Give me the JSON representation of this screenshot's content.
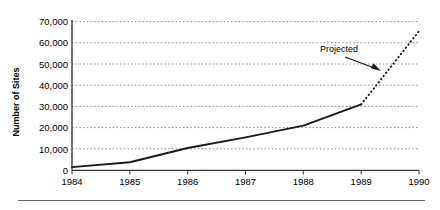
{
  "chart_data": {
    "type": "line",
    "title": "",
    "xlabel": "",
    "ylabel": "Number of Sites",
    "x": [
      1984,
      1985,
      1986,
      1987,
      1988,
      1989,
      1990
    ],
    "xtick_labels": [
      "1984",
      "1985",
      "1986",
      "1987",
      "1988",
      "1989",
      "1990"
    ],
    "ytick_labels": [
      "0",
      "10,000",
      "20,000",
      "30,000",
      "40,000",
      "50,000",
      "60,000",
      "70,000"
    ],
    "ytick_values": [
      0,
      10000,
      20000,
      30000,
      40000,
      50000,
      60000,
      70000
    ],
    "ylim": [
      0,
      70000
    ],
    "xlim": [
      1984,
      1990
    ],
    "grid": "horizontal-dotted",
    "legend": "none",
    "series": [
      {
        "name": "Actual",
        "style": "solid",
        "color": "#1a1a1a",
        "x": [
          1984,
          1985,
          1986,
          1987,
          1988,
          1989
        ],
        "values": [
          1500,
          3800,
          10500,
          15500,
          21000,
          31000
        ]
      },
      {
        "name": "Projected",
        "style": "dotted",
        "color": "#1a1a1a",
        "x": [
          1989,
          1990
        ],
        "values": [
          31000,
          65500
        ]
      }
    ],
    "annotations": [
      {
        "text": "Projected",
        "x": 1988.3,
        "y": 47000,
        "arrow_to_x": 1989.3,
        "arrow_to_y": 38000
      }
    ]
  },
  "axis": {
    "y_title": "Number of Sites"
  },
  "colors": {
    "line": "#1a1a1a",
    "gridline": "#8c8c8c",
    "axis": "#404040",
    "rule": "#666666",
    "background": "#ffffff"
  }
}
